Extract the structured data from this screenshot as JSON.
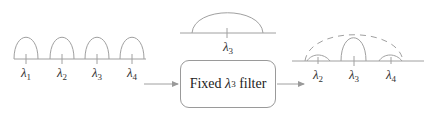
{
  "diagram": {
    "input_spectrum": {
      "channels": [
        {
          "symbol": "λ",
          "sub": "1"
        },
        {
          "symbol": "λ",
          "sub": "2"
        },
        {
          "symbol": "λ",
          "sub": "3"
        },
        {
          "symbol": "λ",
          "sub": "4"
        }
      ]
    },
    "filter_response": {
      "label": {
        "symbol": "λ",
        "sub": "3"
      }
    },
    "filter_box": {
      "prefix": "Fixed ",
      "symbol": "λ",
      "sub": "3",
      "suffix": " filter"
    },
    "output_spectrum": {
      "channels": [
        {
          "symbol": "λ",
          "sub": "2"
        },
        {
          "symbol": "λ",
          "sub": "3"
        },
        {
          "symbol": "λ",
          "sub": "4"
        }
      ],
      "envelope_style": "dashed"
    },
    "colors": {
      "line": "#9a9a9a",
      "text": "#333333"
    }
  }
}
